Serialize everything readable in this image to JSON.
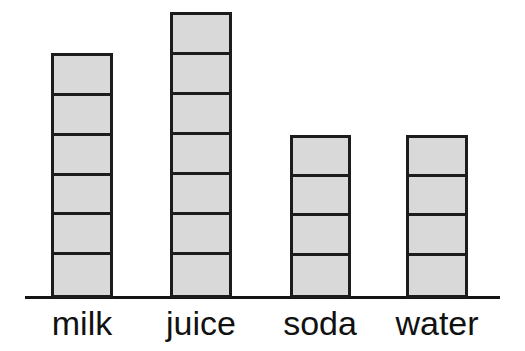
{
  "chart_data": {
    "type": "bar",
    "title": "",
    "subtitle": "",
    "xlabel": "",
    "ylabel": "",
    "categories": [
      "milk",
      "juice",
      "soda",
      "water"
    ],
    "values": [
      6,
      7,
      4,
      4
    ],
    "unit": "squares",
    "ylim": [
      0,
      7
    ],
    "grid": false,
    "legend": null,
    "series": [
      {
        "name": "count",
        "values": [
          6,
          7,
          4,
          4
        ]
      }
    ],
    "style": {
      "bar_fill": "#d9d9d9",
      "bar_stroke": "#1c1c1c",
      "axis_color": "#141414",
      "background": "#ffffff",
      "label_color": "#111111"
    }
  },
  "chart": {
    "bars": [
      {
        "label": "milk",
        "segments": 6,
        "left": 51,
        "width": 62,
        "label_left": 40,
        "label_width": 84
      },
      {
        "label": "juice",
        "segments": 7,
        "left": 170,
        "width": 62,
        "label_left": 157,
        "label_width": 88
      },
      {
        "label": "soda",
        "segments": 4,
        "left": 290,
        "width": 61,
        "label_left": 276,
        "label_width": 88
      },
      {
        "label": "water",
        "segments": 4,
        "left": 406,
        "width": 62,
        "label_left": 386,
        "label_width": 102
      }
    ],
    "segment_height": 40.8,
    "axis": {
      "left": 25,
      "width": 475,
      "top": 296,
      "thickness": 3
    }
  }
}
